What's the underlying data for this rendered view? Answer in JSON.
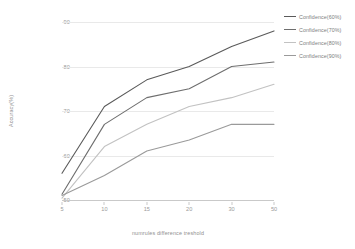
{
  "chart_data": {
    "type": "line",
    "title": "",
    "xlabel": "numrules difference treshold",
    "ylabel": "Accuracy(%)",
    "categories": [
      "5",
      "10",
      "15",
      "20",
      "30",
      "50"
    ],
    "x": [
      5,
      10,
      15,
      20,
      30,
      50
    ],
    "ylim": [
      50,
      90
    ],
    "yticks": [
      50,
      60,
      70,
      80,
      90
    ],
    "grid": true,
    "legend_position": "right",
    "series": [
      {
        "name": "Confidence(60%)",
        "color": "#5a5a5a",
        "values": [
          56,
          71,
          77,
          80,
          84.5,
          88
        ]
      },
      {
        "name": "Confidence(70%)",
        "color": "#6e6e6e",
        "values": [
          51.3,
          67,
          73,
          75,
          80,
          81
        ]
      },
      {
        "name": "Confidence(80%)",
        "color": "#c2c2c2",
        "values": [
          50.4,
          62,
          67,
          71,
          73,
          76
        ]
      },
      {
        "name": "Confidence(90%)",
        "color": "#9a9a9a",
        "values": [
          51,
          55.5,
          61,
          63.5,
          67,
          67
        ]
      }
    ]
  },
  "axes": {
    "ytick_labels": [
      "90",
      "80",
      "70",
      "60",
      "50"
    ],
    "xtick_labels": [
      "5",
      "10",
      "15",
      "20",
      "30",
      "50"
    ]
  },
  "legend": {
    "items": [
      {
        "label": "Confidence(60%)",
        "color": "#5a5a5a"
      },
      {
        "label": "Confidence(70%)",
        "color": "#6e6e6e"
      },
      {
        "label": "Confidence(80%)",
        "color": "#c2c2c2"
      },
      {
        "label": "Confidence(90%)",
        "color": "#9a9a9a"
      }
    ]
  }
}
